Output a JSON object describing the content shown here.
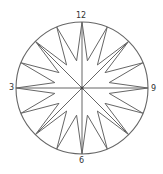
{
  "diagram": {
    "type": "compass-star",
    "center": [
      82,
      88
    ],
    "radius": 66,
    "outer_points": 16,
    "inner_radius_ratio": 0.42,
    "center_rays": 8,
    "stroke_color": "#666666",
    "labels": {
      "top": "12",
      "right": "9",
      "bottom": "6",
      "left": "3"
    }
  }
}
